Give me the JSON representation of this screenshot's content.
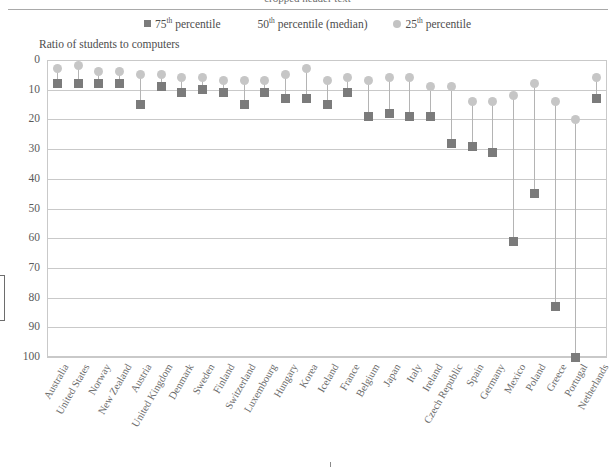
{
  "top_cropped_line": "— cropped header text —",
  "legend": {
    "items": [
      {
        "name": "p75",
        "marker": "square",
        "prefix": "75",
        "sup": "th",
        "suffix": " percentile"
      },
      {
        "name": "p50",
        "marker": "none",
        "prefix": "50",
        "sup": "th",
        "suffix": " percentile (median)"
      },
      {
        "name": "p25",
        "marker": "circle",
        "prefix": "25",
        "sup": "th",
        "suffix": " percentile"
      }
    ],
    "p75_label_prefix": "75",
    "p75_label_sup": "th",
    "p75_label_suffix": " percentile",
    "p50_label_prefix": "50",
    "p50_label_sup": "th",
    "p50_label_suffix": " percentile (median)",
    "p25_label_prefix": "25",
    "p25_label_sup": "th",
    "p25_label_suffix": " percentile"
  },
  "axis_title": "Ratio of students to computers",
  "colors": {
    "p75_square": "#7b7b7b",
    "p25_circle": "#c6c6c6",
    "stem": "#b4b4b4",
    "grid": "#c9c9c9",
    "text": "#5a5a5a"
  },
  "chart_data": {
    "type": "scatter",
    "title": "",
    "subtitle": "",
    "xlabel": "",
    "ylabel": "Ratio of students to computers",
    "ylim": [
      0,
      100
    ],
    "y_inverted": true,
    "yticks": [
      0,
      10,
      20,
      30,
      40,
      50,
      60,
      70,
      80,
      90,
      100
    ],
    "grid": true,
    "legend_position": "top-center",
    "categories": [
      "Australia",
      "United States",
      "Norway",
      "New Zealand",
      "Austria",
      "United Kingdom",
      "Denmark",
      "Sweden",
      "Finland",
      "Switzerland",
      "Luxembourg",
      "Hungary",
      "Korea",
      "Iceland",
      "France",
      "Belgium",
      "Japan",
      "Italy",
      "Ireland",
      "Czech Republic",
      "Spain",
      "Germany",
      "Mexico",
      "Poland",
      "Greece",
      "Portugal",
      "Netherlands"
    ],
    "series": [
      {
        "name": "75th percentile",
        "marker": "square",
        "color": "#7b7b7b",
        "values": [
          8,
          8,
          8,
          8,
          15,
          9,
          11,
          10,
          11,
          15,
          11,
          13,
          13,
          15,
          11,
          19,
          18,
          19,
          19,
          28,
          29,
          31,
          61,
          45,
          83,
          100,
          13
        ]
      },
      {
        "name": "25th percentile",
        "marker": "circle",
        "color": "#c6c6c6",
        "values": [
          3,
          2,
          4,
          4,
          5,
          5,
          6,
          6,
          7,
          7,
          7,
          5,
          3,
          7,
          6,
          7,
          6,
          6,
          9,
          9,
          14,
          14,
          12,
          8,
          14,
          20,
          6
        ]
      }
    ]
  }
}
